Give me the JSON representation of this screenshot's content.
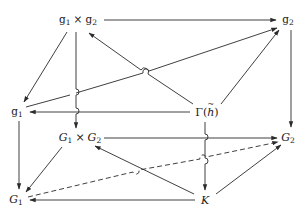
{
  "diagram": {
    "type": "commutative-cube-diagram",
    "nodes": {
      "g1xg2": {
        "label": "𝔤₁ × 𝔤₂",
        "a": "g",
        "a_sub": "1",
        "times": "×",
        "b": "g",
        "b_sub": "2",
        "x": 78,
        "y": 20
      },
      "g2": {
        "label": "𝔤₂",
        "a": "g",
        "a_sub": "2",
        "x": 287,
        "y": 20
      },
      "g1": {
        "label": "𝔤₁",
        "a": "g",
        "a_sub": "1",
        "x": 17,
        "y": 112
      },
      "gamma_h": {
        "label": "Γ(h̃)",
        "a": "Γ(",
        "h": "h",
        "close": ")",
        "x": 207,
        "y": 112
      },
      "G1xG2": {
        "label": "G₁ × G₂",
        "a": "G",
        "a_sub": "1",
        "times": "×",
        "b": "G",
        "b_sub": "2",
        "x": 80,
        "y": 138
      },
      "G2": {
        "label": "G₂",
        "a": "G",
        "a_sub": "2",
        "x": 288,
        "y": 138
      },
      "G1": {
        "label": "G₁",
        "a": "G",
        "a_sub": "1",
        "x": 16,
        "y": 200
      },
      "K": {
        "label": "K",
        "a": "K",
        "x": 205,
        "y": 200
      }
    },
    "edges": [
      {
        "from": "g1xg2",
        "to": "g2",
        "style": "solid"
      },
      {
        "from": "g1xg2",
        "to": "g1",
        "style": "solid"
      },
      {
        "from": "g1xg2",
        "to": "G1xG2",
        "style": "solid"
      },
      {
        "from": "gamma_h",
        "to": "g1xg2",
        "style": "solid"
      },
      {
        "from": "g1",
        "to": "g2",
        "style": "solid"
      },
      {
        "from": "gamma_h",
        "to": "g2",
        "style": "solid"
      },
      {
        "from": "g2",
        "to": "G2",
        "style": "solid"
      },
      {
        "from": "gamma_h",
        "to": "g1",
        "style": "solid"
      },
      {
        "from": "g1",
        "to": "G1",
        "style": "solid"
      },
      {
        "from": "gamma_h",
        "to": "K",
        "style": "solid"
      },
      {
        "from": "G1xG2",
        "to": "G2",
        "style": "solid"
      },
      {
        "from": "G1xG2",
        "to": "G1",
        "style": "solid"
      },
      {
        "from": "K",
        "to": "G1xG2",
        "style": "solid"
      },
      {
        "from": "G1",
        "to": "G2",
        "style": "dashed"
      },
      {
        "from": "K",
        "to": "G2",
        "style": "solid"
      },
      {
        "from": "K",
        "to": "G1",
        "style": "solid"
      }
    ],
    "colors": {
      "line": "#2a2a2a",
      "text": "#1a1a1a",
      "background": "#ffffff"
    }
  }
}
